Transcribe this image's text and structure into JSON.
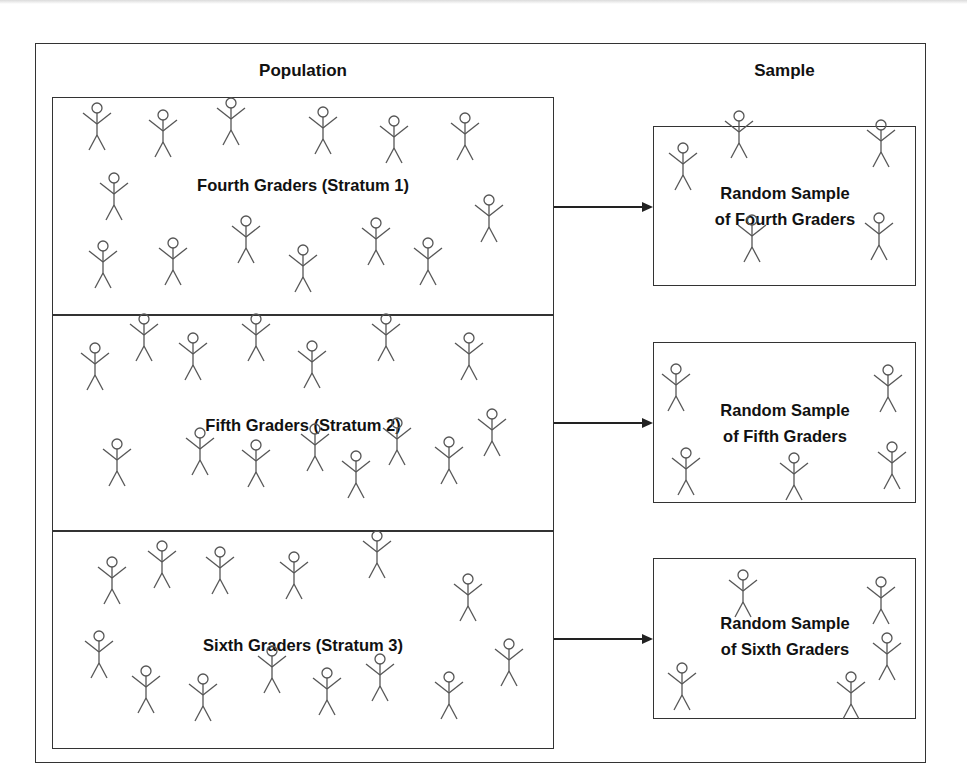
{
  "headers": {
    "population": "Population",
    "sample": "Sample"
  },
  "strata": [
    {
      "label": "Fourth Graders (Stratum 1)",
      "sample_line1": "Random Sample",
      "sample_line2": "of Fourth Graders",
      "population_figures": 14,
      "sample_figures": 5
    },
    {
      "label": "Fifth Graders (Stratum 2)",
      "sample_line1": "Random Sample",
      "sample_line2": "of Fifth Graders",
      "population_figures": 15,
      "sample_figures": 5
    },
    {
      "label": "Sixth Graders (Stratum 3)",
      "sample_line1": "Random Sample",
      "sample_line2": "of Sixth Graders",
      "population_figures": 15,
      "sample_figures": 5
    }
  ],
  "icons": {
    "figure": "stick-figure-icon",
    "arrow": "right-arrow-icon"
  },
  "colors": {
    "line": "#333333",
    "figure": "#555555",
    "background": "#ffffff"
  },
  "figure_positions": {
    "stratum1": [
      [
        97,
        103
      ],
      [
        163,
        110
      ],
      [
        231,
        98
      ],
      [
        323,
        107
      ],
      [
        394,
        116
      ],
      [
        465,
        113
      ],
      [
        114,
        173
      ],
      [
        103,
        241
      ],
      [
        173,
        238
      ],
      [
        246,
        216
      ],
      [
        303,
        245
      ],
      [
        376,
        218
      ],
      [
        428,
        238
      ],
      [
        489,
        195
      ]
    ],
    "sample1": [
      [
        683,
        143
      ],
      [
        739,
        111
      ],
      [
        881,
        120
      ],
      [
        752,
        215
      ],
      [
        879,
        213
      ]
    ],
    "stratum2": [
      [
        95,
        343
      ],
      [
        144,
        314
      ],
      [
        193,
        333
      ],
      [
        256,
        314
      ],
      [
        312,
        341
      ],
      [
        386,
        314
      ],
      [
        469,
        333
      ],
      [
        117,
        439
      ],
      [
        200,
        428
      ],
      [
        256,
        440
      ],
      [
        315,
        424
      ],
      [
        356,
        451
      ],
      [
        397,
        418
      ],
      [
        449,
        437
      ],
      [
        492,
        409
      ]
    ],
    "sample2": [
      [
        676,
        364
      ],
      [
        888,
        365
      ],
      [
        686,
        448
      ],
      [
        794,
        453
      ],
      [
        892,
        442
      ]
    ],
    "stratum3": [
      [
        112,
        557
      ],
      [
        162,
        541
      ],
      [
        220,
        547
      ],
      [
        294,
        552
      ],
      [
        377,
        531
      ],
      [
        468,
        574
      ],
      [
        99,
        631
      ],
      [
        146,
        666
      ],
      [
        203,
        674
      ],
      [
        272,
        646
      ],
      [
        327,
        668
      ],
      [
        380,
        654
      ],
      [
        449,
        672
      ],
      [
        509,
        639
      ]
    ],
    "sample3": [
      [
        743,
        570
      ],
      [
        881,
        577
      ],
      [
        682,
        663
      ],
      [
        851,
        672
      ],
      [
        887,
        633
      ]
    ]
  }
}
